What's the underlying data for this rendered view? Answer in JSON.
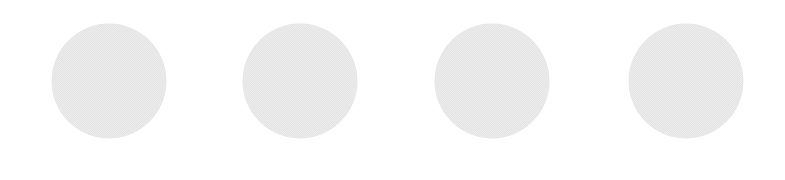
{
  "canvas": {
    "width": 785,
    "height": 180,
    "background_color": "#ffffff"
  },
  "figure": {
    "type": "dot-row",
    "shape": "circle",
    "count": 4,
    "fill_color": "#d6d6d6",
    "texture": "halftone-dither",
    "edge": "soft-antialiased",
    "has_text": false,
    "has_labels": false,
    "has_border": false
  },
  "dots": [
    {
      "id": "dot-1",
      "cx": 109,
      "cy": 81,
      "diameter": 114,
      "fill_color": "#d6d6d6"
    },
    {
      "id": "dot-2",
      "cx": 300,
      "cy": 81,
      "diameter": 114,
      "fill_color": "#d6d6d6"
    },
    {
      "id": "dot-3",
      "cx": 492,
      "cy": 81,
      "diameter": 114,
      "fill_color": "#d6d6d6"
    },
    {
      "id": "dot-4",
      "cx": 686,
      "cy": 81,
      "diameter": 114,
      "fill_color": "#d6d6d6"
    }
  ]
}
